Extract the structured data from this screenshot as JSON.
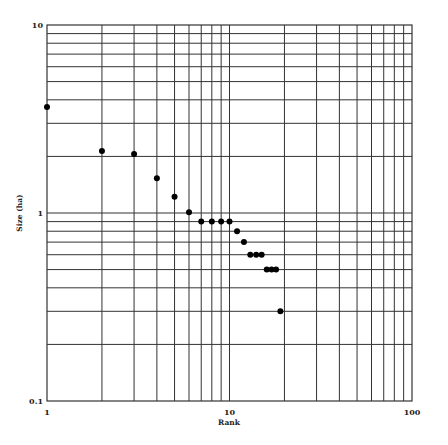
{
  "chart_data": {
    "type": "scatter",
    "title": "",
    "xlabel": "Rank",
    "ylabel": "Size (ha)",
    "xscale": "log",
    "yscale": "log",
    "xlim": [
      1,
      100
    ],
    "ylim": [
      0.1,
      10
    ],
    "grid": true,
    "legend": "none",
    "x_ticks": [
      {
        "value": 1,
        "label": "1"
      },
      {
        "value": 10,
        "label": "10"
      },
      {
        "value": 100,
        "label": "100"
      }
    ],
    "y_ticks": [
      {
        "value": 0.1,
        "label": "0.1"
      },
      {
        "value": 1,
        "label": "1"
      },
      {
        "value": 10,
        "label": "10"
      }
    ],
    "points": [
      {
        "x": 1,
        "y": 3.66
      },
      {
        "x": 2,
        "y": 2.14
      },
      {
        "x": 3,
        "y": 2.06
      },
      {
        "x": 4,
        "y": 1.53
      },
      {
        "x": 5,
        "y": 1.22
      },
      {
        "x": 6,
        "y": 1.01
      },
      {
        "x": 7,
        "y": 0.9
      },
      {
        "x": 8,
        "y": 0.9
      },
      {
        "x": 9,
        "y": 0.9
      },
      {
        "x": 10,
        "y": 0.9
      },
      {
        "x": 11,
        "y": 0.8
      },
      {
        "x": 12,
        "y": 0.7
      },
      {
        "x": 13,
        "y": 0.6
      },
      {
        "x": 14,
        "y": 0.6
      },
      {
        "x": 15,
        "y": 0.6
      },
      {
        "x": 16,
        "y": 0.5
      },
      {
        "x": 17,
        "y": 0.5
      },
      {
        "x": 18,
        "y": 0.5
      },
      {
        "x": 19,
        "y": 0.3
      }
    ]
  }
}
